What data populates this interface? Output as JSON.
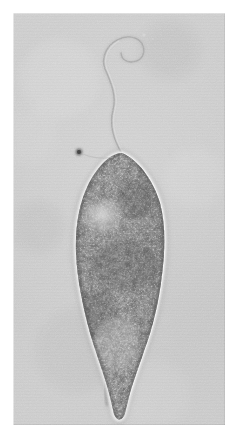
{
  "image": {
    "kind": "photomicrograph",
    "title": "Flagellated protozoan photomicrograph",
    "modality": "brightfield-phase-contrast light microscopy",
    "rendering": "grayscale",
    "orientation": "portrait",
    "subject": "single elongate flagellate cell, anterior end upper, tapering posterior tail lower",
    "background_color": "#c9c9c9",
    "page_color": "#ffffff",
    "plate": {
      "left": 13,
      "top": 13,
      "width": 212,
      "height": 412,
      "border": "none, plain light-grey field"
    },
    "features": [
      {
        "name": "flagellum",
        "description": "single long anterior flagellum, very faint pale grey, curving up from the cell apex, sweeping right then looping back into a small open hook at the top",
        "color": "#b9b9b9",
        "approx_path_points": "apex (122,152) -> (112,120) -> (116,92) -> (104,62) -> (110,40) -> loop (126,32) -> (133,46) -> (118,48)"
      },
      {
        "name": "cell-body",
        "description": "spindle / teardrop shaped cell, widest near upper third, narrowing to a long tapering posterior tail",
        "widest_x_range": "75 to 157",
        "widest_y": "about 210",
        "apex_y": "about 152",
        "tail_tip_y": "about 415"
      },
      {
        "name": "pellicle-halo",
        "description": "bright white phase-contrast halo outlining the entire cell margin",
        "color": "#f2f2f2"
      },
      {
        "name": "cytoplasm-granules",
        "description": "dense coarse granular cytoplasm, speckled dark-grey to black with scattered bright highlights",
        "dark_color": "#303030",
        "light_color": "#e0e0e0"
      },
      {
        "name": "clear-zone",
        "description": "paler less granular region in the mid-upper body, slightly left of centre",
        "color": "#cfcfcf"
      },
      {
        "name": "posterior-tail",
        "description": "narrow pale tapering caudal process extending below the granular body to a blunt rounded tip",
        "color": "#d5d5d5"
      },
      {
        "name": "dark-particle",
        "description": "small round dark speck in the field just left of the cell apex, possibly debris or a detached granule",
        "position": "x 78, y 152",
        "color": "#4a4a4a"
      }
    ],
    "text_content": "none - the image contains no labels, scale bar, captions or annotations"
  }
}
